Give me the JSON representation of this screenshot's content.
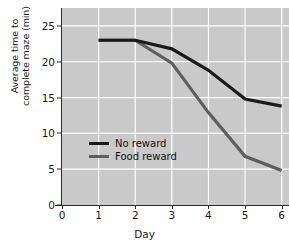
{
  "chart_data": {
    "type": "line",
    "title": "",
    "xlabel": "Day",
    "ylabel_line1": "Average time to",
    "ylabel_line2": "complete maze (min)",
    "x": [
      1,
      2,
      3,
      4,
      5,
      6
    ],
    "xlim": [
      0,
      6.2
    ],
    "ylim": [
      0,
      27.5
    ],
    "xticks": [
      "0",
      "1",
      "2",
      "3",
      "4",
      "5",
      "6"
    ],
    "xtick_values": [
      0,
      1,
      2,
      3,
      4,
      5,
      6
    ],
    "yticks": [
      "0",
      "5",
      "10",
      "15",
      "20",
      "25"
    ],
    "ytick_values": [
      0,
      5,
      10,
      15,
      20,
      25
    ],
    "grid": true,
    "grid_color": "#ffffff",
    "plot_background": "#c9c9c9",
    "legend_position": "center-left-inside",
    "series": [
      {
        "name": "No reward",
        "color": "#1a1a1a",
        "values": [
          23.0,
          23.0,
          21.8,
          18.8,
          14.8,
          13.8
        ]
      },
      {
        "name": "Food reward",
        "color": "#5e5e5e",
        "values": [
          23.0,
          23.0,
          19.8,
          12.9,
          6.8,
          4.8
        ]
      }
    ]
  },
  "legend": {
    "items": [
      {
        "label": "No reward",
        "color": "#1a1a1a"
      },
      {
        "label": "Food reward",
        "color": "#5e5e5e"
      }
    ]
  }
}
